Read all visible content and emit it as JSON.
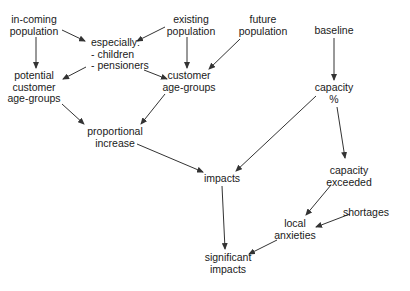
{
  "diagram": {
    "type": "flow-diagram",
    "nodes": {
      "incoming_population": {
        "label": "in-coming\npopulation",
        "x": 34,
        "y": 14
      },
      "existing_population": {
        "label": "existing\npopulation",
        "x": 191,
        "y": 14
      },
      "future_population": {
        "label": "future\npopulation",
        "x": 263,
        "y": 14
      },
      "baseline": {
        "label": "baseline",
        "x": 334,
        "y": 25
      },
      "especially": {
        "label": "especially:\n- children\n- pensioners",
        "x": 91,
        "y": 37
      },
      "potential_customer_age_groups": {
        "label": "potential\ncustomer\nage-groups",
        "x": 34,
        "y": 70
      },
      "customer_age_groups": {
        "label": "customer\nage-groups",
        "x": 189,
        "y": 70
      },
      "capacity_pct": {
        "label": "capacity\n%",
        "x": 334,
        "y": 82
      },
      "proportional_increase": {
        "label": "proportional\nincrease",
        "x": 115,
        "y": 126
      },
      "impacts": {
        "label": "impacts",
        "x": 222,
        "y": 173
      },
      "capacity_exceeded": {
        "label": "capacity\nexceeded",
        "x": 349,
        "y": 165
      },
      "shortages": {
        "label": "shortages",
        "x": 366,
        "y": 207
      },
      "local_anxieties": {
        "label": "local\nanxieties",
        "x": 295,
        "y": 218
      },
      "significant_impacts": {
        "label": "significant\nimpacts",
        "x": 228,
        "y": 252
      }
    },
    "edges": [
      {
        "from": "incoming_population",
        "to": "especially",
        "x1": 62,
        "y1": 30,
        "x2": 85,
        "y2": 41
      },
      {
        "from": "existing_population",
        "to": "especially",
        "x1": 165,
        "y1": 27,
        "x2": 137,
        "y2": 41
      },
      {
        "from": "incoming_population",
        "to": "potential_customer_age_groups",
        "x1": 36,
        "y1": 37,
        "x2": 36,
        "y2": 68
      },
      {
        "from": "existing_population",
        "to": "customer_age_groups",
        "x1": 187,
        "y1": 37,
        "x2": 187,
        "y2": 68
      },
      {
        "from": "future_population",
        "to": "customer_age_groups",
        "x1": 240,
        "y1": 39,
        "x2": 209,
        "y2": 69
      },
      {
        "from": "especially",
        "to": "potential_customer_age_groups",
        "x1": 86,
        "y1": 67,
        "x2": 63,
        "y2": 79
      },
      {
        "from": "especially",
        "to": "customer_age_groups",
        "x1": 144,
        "y1": 70,
        "x2": 167,
        "y2": 79
      },
      {
        "from": "potential_customer_age_groups",
        "to": "proportional_increase",
        "x1": 62,
        "y1": 104,
        "x2": 84,
        "y2": 124
      },
      {
        "from": "customer_age_groups",
        "to": "proportional_increase",
        "x1": 165,
        "y1": 94,
        "x2": 141,
        "y2": 124
      },
      {
        "from": "baseline",
        "to": "capacity_pct",
        "x1": 334,
        "y1": 38,
        "x2": 334,
        "y2": 80
      },
      {
        "from": "proportional_increase",
        "to": "impacts",
        "x1": 137,
        "y1": 144,
        "x2": 203,
        "y2": 172
      },
      {
        "from": "capacity_pct",
        "to": "impacts",
        "x1": 316,
        "y1": 96,
        "x2": 236,
        "y2": 171
      },
      {
        "from": "capacity_pct",
        "to": "capacity_exceeded",
        "x1": 337,
        "y1": 107,
        "x2": 345,
        "y2": 158
      },
      {
        "from": "impacts",
        "to": "significant_impacts",
        "x1": 222,
        "y1": 186,
        "x2": 225,
        "y2": 249
      },
      {
        "from": "capacity_exceeded",
        "to": "local_anxieties",
        "x1": 331,
        "y1": 185,
        "x2": 306,
        "y2": 215
      },
      {
        "from": "shortages",
        "to": "local_anxieties",
        "x1": 350,
        "y1": 214,
        "x2": 316,
        "y2": 227
      },
      {
        "from": "local_anxieties",
        "to": "significant_impacts",
        "x1": 277,
        "y1": 240,
        "x2": 249,
        "y2": 254
      }
    ],
    "colors": {
      "text": "#1a1a1a",
      "line": "#333333",
      "background": "#ffffff"
    }
  }
}
